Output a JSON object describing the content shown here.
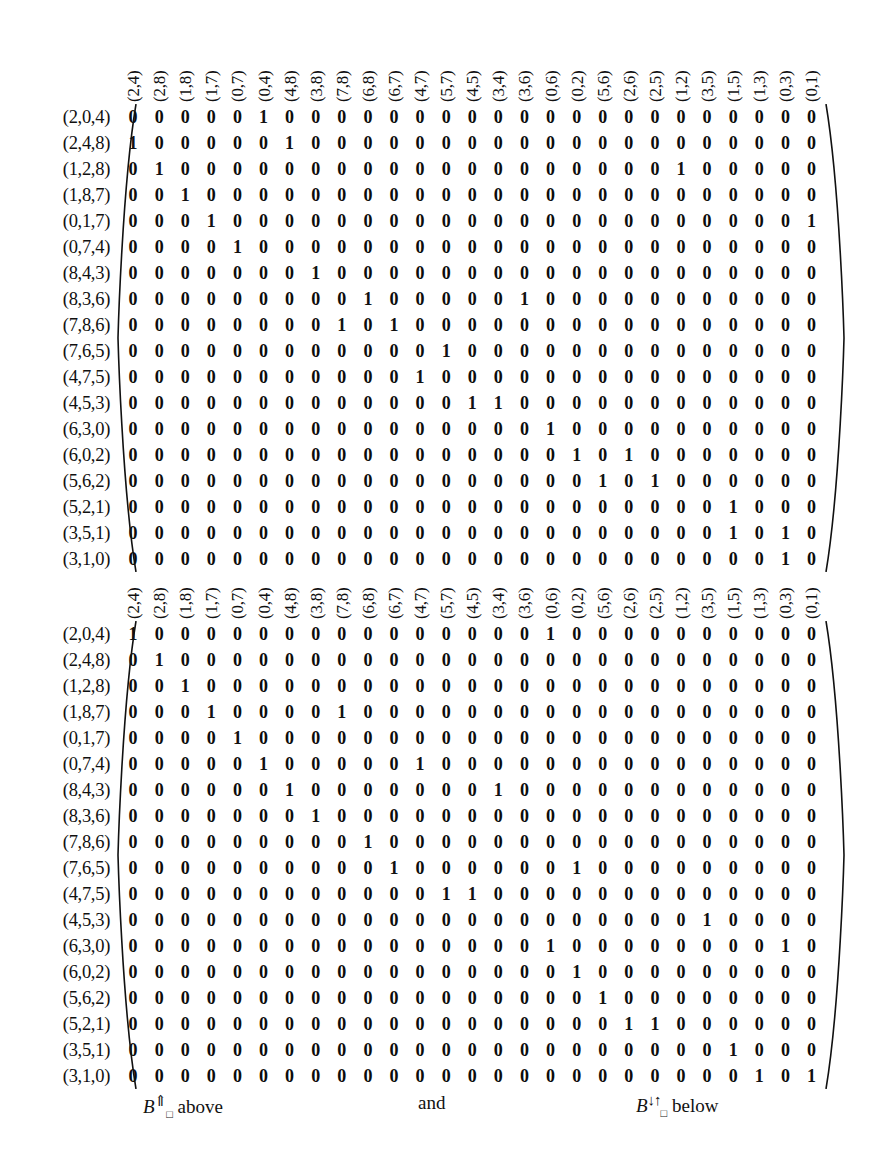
{
  "figure": {
    "type": "matrix-pair",
    "column_headers": [
      "(2,4)",
      "(2,8)",
      "(1,8)",
      "(1,7)",
      "(0,7)",
      "(0,4)",
      "(4,8)",
      "(3,8)",
      "(7,8)",
      "(6,8)",
      "(6,7)",
      "(4,7)",
      "(5,7)",
      "(4,5)",
      "(3,4)",
      "(3,6)",
      "(0,6)",
      "(0,2)",
      "(5,6)",
      "(2,6)",
      "(2,5)",
      "(1,2)",
      "(3,5)",
      "(1,5)",
      "(1,3)",
      "(0,3)",
      "(0,1)"
    ],
    "row_labels": [
      "(2,0,4)",
      "(2,4,8)",
      "(1,2,8)",
      "(1,8,7)",
      "(0,1,7)",
      "(0,7,4)",
      "(8,4,3)",
      "(8,3,6)",
      "(7,8,6)",
      "(7,6,5)",
      "(4,7,5)",
      "(4,5,3)",
      "(6,3,0)",
      "(6,0,2)",
      "(5,6,2)",
      "(5,2,1)",
      "(3,5,1)",
      "(3,1,0)"
    ],
    "matrices": [
      {
        "id": "B-up",
        "label_math": "B",
        "label_arrow": "⇑",
        "label_sub": "□",
        "label_position": "above",
        "rows": [
          [
            0,
            0,
            0,
            0,
            0,
            1,
            0,
            0,
            0,
            0,
            0,
            0,
            0,
            0,
            0,
            0,
            0,
            0,
            0,
            0,
            0,
            0,
            0,
            0,
            0,
            0,
            0
          ],
          [
            1,
            0,
            0,
            0,
            0,
            0,
            1,
            0,
            0,
            0,
            0,
            0,
            0,
            0,
            0,
            0,
            0,
            0,
            0,
            0,
            0,
            0,
            0,
            0,
            0,
            0,
            0
          ],
          [
            0,
            1,
            0,
            0,
            0,
            0,
            0,
            0,
            0,
            0,
            0,
            0,
            0,
            0,
            0,
            0,
            0,
            0,
            0,
            0,
            0,
            1,
            0,
            0,
            0,
            0,
            0
          ],
          [
            0,
            0,
            1,
            0,
            0,
            0,
            0,
            0,
            0,
            0,
            0,
            0,
            0,
            0,
            0,
            0,
            0,
            0,
            0,
            0,
            0,
            0,
            0,
            0,
            0,
            0,
            0
          ],
          [
            0,
            0,
            0,
            1,
            0,
            0,
            0,
            0,
            0,
            0,
            0,
            0,
            0,
            0,
            0,
            0,
            0,
            0,
            0,
            0,
            0,
            0,
            0,
            0,
            0,
            0,
            1
          ],
          [
            0,
            0,
            0,
            0,
            1,
            0,
            0,
            0,
            0,
            0,
            0,
            0,
            0,
            0,
            0,
            0,
            0,
            0,
            0,
            0,
            0,
            0,
            0,
            0,
            0,
            0,
            0
          ],
          [
            0,
            0,
            0,
            0,
            0,
            0,
            0,
            1,
            0,
            0,
            0,
            0,
            0,
            0,
            0,
            0,
            0,
            0,
            0,
            0,
            0,
            0,
            0,
            0,
            0,
            0,
            0
          ],
          [
            0,
            0,
            0,
            0,
            0,
            0,
            0,
            0,
            0,
            1,
            0,
            0,
            0,
            0,
            0,
            1,
            0,
            0,
            0,
            0,
            0,
            0,
            0,
            0,
            0,
            0,
            0
          ],
          [
            0,
            0,
            0,
            0,
            0,
            0,
            0,
            0,
            1,
            0,
            1,
            0,
            0,
            0,
            0,
            0,
            0,
            0,
            0,
            0,
            0,
            0,
            0,
            0,
            0,
            0,
            0
          ],
          [
            0,
            0,
            0,
            0,
            0,
            0,
            0,
            0,
            0,
            0,
            0,
            0,
            1,
            0,
            0,
            0,
            0,
            0,
            0,
            0,
            0,
            0,
            0,
            0,
            0,
            0,
            0
          ],
          [
            0,
            0,
            0,
            0,
            0,
            0,
            0,
            0,
            0,
            0,
            0,
            1,
            0,
            0,
            0,
            0,
            0,
            0,
            0,
            0,
            0,
            0,
            0,
            0,
            0,
            0,
            0
          ],
          [
            0,
            0,
            0,
            0,
            0,
            0,
            0,
            0,
            0,
            0,
            0,
            0,
            0,
            1,
            1,
            0,
            0,
            0,
            0,
            0,
            0,
            0,
            0,
            0,
            0,
            0,
            0
          ],
          [
            0,
            0,
            0,
            0,
            0,
            0,
            0,
            0,
            0,
            0,
            0,
            0,
            0,
            0,
            0,
            0,
            1,
            0,
            0,
            0,
            0,
            0,
            0,
            0,
            0,
            0,
            0
          ],
          [
            0,
            0,
            0,
            0,
            0,
            0,
            0,
            0,
            0,
            0,
            0,
            0,
            0,
            0,
            0,
            0,
            0,
            1,
            0,
            1,
            0,
            0,
            0,
            0,
            0,
            0,
            0
          ],
          [
            0,
            0,
            0,
            0,
            0,
            0,
            0,
            0,
            0,
            0,
            0,
            0,
            0,
            0,
            0,
            0,
            0,
            0,
            1,
            0,
            1,
            0,
            0,
            0,
            0,
            0,
            0
          ],
          [
            0,
            0,
            0,
            0,
            0,
            0,
            0,
            0,
            0,
            0,
            0,
            0,
            0,
            0,
            0,
            0,
            0,
            0,
            0,
            0,
            0,
            0,
            0,
            1,
            0,
            0,
            0
          ],
          [
            0,
            0,
            0,
            0,
            0,
            0,
            0,
            0,
            0,
            0,
            0,
            0,
            0,
            0,
            0,
            0,
            0,
            0,
            0,
            0,
            0,
            0,
            0,
            1,
            0,
            1,
            0
          ],
          [
            0,
            0,
            0,
            0,
            0,
            0,
            0,
            0,
            0,
            0,
            0,
            0,
            0,
            0,
            0,
            0,
            0,
            0,
            0,
            0,
            0,
            0,
            0,
            0,
            0,
            1,
            0
          ]
        ]
      },
      {
        "id": "B-downup",
        "label_math": "B",
        "label_arrow": "↓↑",
        "label_sub": "□",
        "label_position": "below",
        "rows": [
          [
            1,
            0,
            0,
            0,
            0,
            0,
            0,
            0,
            0,
            0,
            0,
            0,
            0,
            0,
            0,
            0,
            1,
            0,
            0,
            0,
            0,
            0,
            0,
            0,
            0,
            0,
            0
          ],
          [
            0,
            1,
            0,
            0,
            0,
            0,
            0,
            0,
            0,
            0,
            0,
            0,
            0,
            0,
            0,
            0,
            0,
            0,
            0,
            0,
            0,
            0,
            0,
            0,
            0,
            0,
            0
          ],
          [
            0,
            0,
            1,
            0,
            0,
            0,
            0,
            0,
            0,
            0,
            0,
            0,
            0,
            0,
            0,
            0,
            0,
            0,
            0,
            0,
            0,
            0,
            0,
            0,
            0,
            0,
            0
          ],
          [
            0,
            0,
            0,
            1,
            0,
            0,
            0,
            0,
            1,
            0,
            0,
            0,
            0,
            0,
            0,
            0,
            0,
            0,
            0,
            0,
            0,
            0,
            0,
            0,
            0,
            0,
            0
          ],
          [
            0,
            0,
            0,
            0,
            1,
            0,
            0,
            0,
            0,
            0,
            0,
            0,
            0,
            0,
            0,
            0,
            0,
            0,
            0,
            0,
            0,
            0,
            0,
            0,
            0,
            0,
            0
          ],
          [
            0,
            0,
            0,
            0,
            0,
            1,
            0,
            0,
            0,
            0,
            0,
            1,
            0,
            0,
            0,
            0,
            0,
            0,
            0,
            0,
            0,
            0,
            0,
            0,
            0,
            0,
            0
          ],
          [
            0,
            0,
            0,
            0,
            0,
            0,
            1,
            0,
            0,
            0,
            0,
            0,
            0,
            0,
            1,
            0,
            0,
            0,
            0,
            0,
            0,
            0,
            0,
            0,
            0,
            0,
            0
          ],
          [
            0,
            0,
            0,
            0,
            0,
            0,
            0,
            1,
            0,
            0,
            0,
            0,
            0,
            0,
            0,
            0,
            0,
            0,
            0,
            0,
            0,
            0,
            0,
            0,
            0,
            0,
            0
          ],
          [
            0,
            0,
            0,
            0,
            0,
            0,
            0,
            0,
            0,
            1,
            0,
            0,
            0,
            0,
            0,
            0,
            0,
            0,
            0,
            0,
            0,
            0,
            0,
            0,
            0,
            0,
            0
          ],
          [
            0,
            0,
            0,
            0,
            0,
            0,
            0,
            0,
            0,
            0,
            1,
            0,
            0,
            0,
            0,
            0,
            0,
            1,
            0,
            0,
            0,
            0,
            0,
            0,
            0,
            0,
            0
          ],
          [
            0,
            0,
            0,
            0,
            0,
            0,
            0,
            0,
            0,
            0,
            0,
            0,
            1,
            1,
            0,
            0,
            0,
            0,
            0,
            0,
            0,
            0,
            0,
            0,
            0,
            0,
            0
          ],
          [
            0,
            0,
            0,
            0,
            0,
            0,
            0,
            0,
            0,
            0,
            0,
            0,
            0,
            0,
            0,
            0,
            0,
            0,
            0,
            0,
            0,
            0,
            1,
            0,
            0,
            0,
            0
          ],
          [
            0,
            0,
            0,
            0,
            0,
            0,
            0,
            0,
            0,
            0,
            0,
            0,
            0,
            0,
            0,
            0,
            1,
            0,
            0,
            0,
            0,
            0,
            0,
            0,
            0,
            1,
            0
          ],
          [
            0,
            0,
            0,
            0,
            0,
            0,
            0,
            0,
            0,
            0,
            0,
            0,
            0,
            0,
            0,
            0,
            0,
            1,
            0,
            0,
            0,
            0,
            0,
            0,
            0,
            0,
            0
          ],
          [
            0,
            0,
            0,
            0,
            0,
            0,
            0,
            0,
            0,
            0,
            0,
            0,
            0,
            0,
            0,
            0,
            0,
            0,
            1,
            0,
            0,
            0,
            0,
            0,
            0,
            0,
            0
          ],
          [
            0,
            0,
            0,
            0,
            0,
            0,
            0,
            0,
            0,
            0,
            0,
            0,
            0,
            0,
            0,
            0,
            0,
            0,
            0,
            1,
            1,
            0,
            0,
            0,
            0,
            0,
            0
          ],
          [
            0,
            0,
            0,
            0,
            0,
            0,
            0,
            0,
            0,
            0,
            0,
            0,
            0,
            0,
            0,
            0,
            0,
            0,
            0,
            0,
            0,
            0,
            0,
            1,
            0,
            0,
            0
          ],
          [
            0,
            0,
            0,
            0,
            0,
            0,
            0,
            0,
            0,
            0,
            0,
            0,
            0,
            0,
            0,
            0,
            0,
            0,
            0,
            0,
            0,
            0,
            0,
            0,
            1,
            0,
            1
          ]
        ]
      }
    ]
  },
  "caption": {
    "left_math": "B",
    "left_arrow": "⇑",
    "left_sub": "□",
    "left_text": "above",
    "middle_text": "and",
    "right_math": "B",
    "right_arrow": "↓↑",
    "right_sub": "□",
    "right_text": "below"
  }
}
